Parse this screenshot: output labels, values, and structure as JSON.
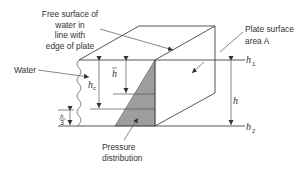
{
  "diagram": {
    "labels": {
      "free_surface": [
        "Free surface of",
        "water in",
        "line with",
        "edge of plate"
      ],
      "water": "Water",
      "plate_surface": [
        "Plate surface",
        "area A"
      ],
      "pressure_distribution": [
        "Pressure",
        "distribution"
      ],
      "h1": "h",
      "h1_sub": "1",
      "h2": "h",
      "h2_sub": "2",
      "h": "h",
      "h_bar": "h",
      "h_c": "h",
      "h_c_sub": "c",
      "h_over_3_num": "h",
      "h_over_3_den": "3"
    },
    "colors": {
      "line": "#444444",
      "pressure_fill": "#9e9e9e",
      "text": "#333333",
      "background": "#ffffff"
    }
  }
}
